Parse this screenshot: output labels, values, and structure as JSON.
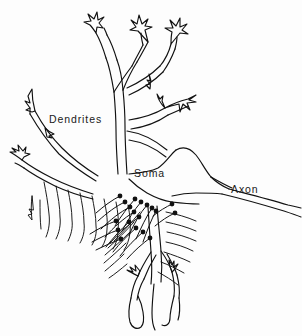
{
  "figure": {
    "background_color": "#fdfdfd",
    "ink_color": "#111111",
    "width": 302,
    "height": 336
  },
  "labels": {
    "dendrites": "Dendrites",
    "soma": "Soma",
    "axon": "Axon"
  },
  "parts": {
    "dendrite_tree_name": "dendrite-tree",
    "soma_name": "soma-body",
    "axon_name": "axon-fiber",
    "synaptic_boutons_name": "synaptic-boutons",
    "afferent_fibers_name": "afferent-fibers"
  },
  "counts": {
    "dendrite_terminals": 8,
    "synaptic_boutons": 19,
    "afferent_fibers": 22
  }
}
